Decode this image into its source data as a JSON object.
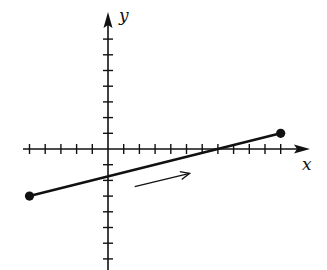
{
  "chart_data": {
    "type": "line",
    "title": "",
    "xlabel": "x",
    "ylabel": "y",
    "grid": false,
    "x_ticks": [
      -5,
      -4,
      -3,
      -2,
      -1,
      1,
      2,
      3,
      4,
      5,
      6,
      7,
      8,
      9,
      10,
      11
    ],
    "y_ticks": [
      -7,
      -6,
      -5,
      -4,
      -3,
      -2,
      -1,
      1,
      2,
      3,
      4,
      5,
      6,
      7
    ],
    "xlim": [
      -5,
      12.5
    ],
    "ylim": [
      -7.5,
      8.6
    ],
    "series": [
      {
        "name": "segment",
        "x": [
          -5,
          11
        ],
        "y": [
          -3,
          1
        ],
        "endpoints": "closed-dots"
      }
    ],
    "annotations": [
      {
        "type": "direction-arrow",
        "from": [
          1.7,
          -2.4
        ],
        "to": [
          5.2,
          -1.55
        ],
        "meaning": "direction of motion along segment (left to right)"
      }
    ]
  },
  "axes": {
    "x_label": "x",
    "y_label": "y",
    "color": "#111111"
  },
  "layout": {
    "origin_px": [
      108,
      149
    ],
    "unit_px": 15.7,
    "x_arrow_end_px": 310,
    "y_arrow_end_px": 12,
    "x_axis_start_px": 23,
    "y_axis_end_px": 270
  }
}
